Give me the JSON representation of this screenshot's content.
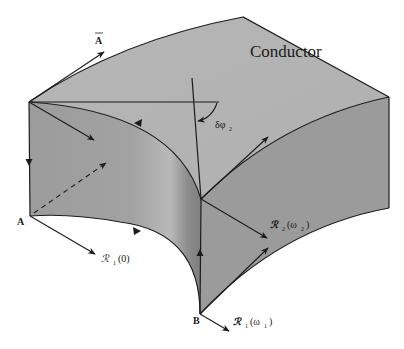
{
  "diagram": {
    "title_label": "Conductor",
    "labels": {
      "vector_a": "A",
      "point_a": "A",
      "point_b": "B",
      "delta_phi": "δφ",
      "delta_phi_sub": "2",
      "r1_zero_main": "ℛ",
      "r1_zero_sub": "1",
      "r1_zero_arg": "(0)",
      "r2_main": "ℛ",
      "r2_sub": "2",
      "r2_arg_open": "(ω",
      "r2_arg_sub": "2",
      "r2_arg_close": ")",
      "r1_omega_main": "ℛ",
      "r1_omega_sub": "1",
      "r1_omega_arg_open": "(ω",
      "r1_omega_arg_sub": "1",
      "r1_omega_arg_close": ")"
    },
    "colors": {
      "top_face": "#b4b4b4",
      "left_face": "#9a9a9a",
      "right_face": "#999999",
      "edge": "#1c1c1c",
      "background": "#ffffff"
    }
  }
}
